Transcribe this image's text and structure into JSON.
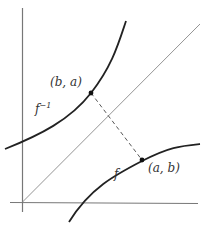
{
  "diagram": {
    "type": "function-inverse-reflection",
    "labels": {
      "point_upper": "(b, a)",
      "point_lower": "(a, b)",
      "inverse_function": "f",
      "inverse_superscript": "−1",
      "function": "f"
    },
    "elements": {
      "axes": [
        "vertical-axis",
        "horizontal-axis"
      ],
      "line": "y = x diagonal",
      "curves": [
        "f",
        "f^-1"
      ],
      "points": [
        "(b, a)",
        "(a, b)"
      ],
      "connector": "dashed segment between reflected points"
    },
    "colors": {
      "axis": "#777777",
      "diagonal": "#777777",
      "curve": "#222222",
      "dashed": "#444444",
      "point": "#111111",
      "text": "#333333"
    }
  }
}
